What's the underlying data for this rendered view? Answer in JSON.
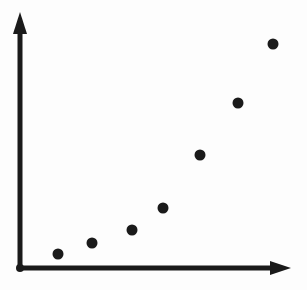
{
  "figure": {
    "name": "scatter-plot-diagram",
    "width": 307,
    "height": 290,
    "background_color": "#fdfdfd",
    "ink_color": "#1a1a1a",
    "has_labels": false,
    "has_tick_marks": false,
    "has_gridlines": false,
    "has_title": false,
    "has_legend": false
  },
  "axes": {
    "y_axis": {
      "name": "y-axis",
      "x": 20,
      "y_bottom": 268,
      "y_top": 12,
      "stroke_width": 5,
      "arrowhead": {
        "name": "y-axis-arrowhead",
        "tip_x": 20,
        "tip_y": 12,
        "base_y": 34,
        "half_width": 7
      }
    },
    "x_axis": {
      "name": "x-axis",
      "y": 268,
      "x_left": 20,
      "x_right": 291,
      "stroke_width": 5,
      "arrowhead": {
        "name": "x-axis-arrowhead",
        "tip_x": 291,
        "tip_y": 268,
        "base_x": 270,
        "half_height": 7
      }
    },
    "origin": {
      "name": "origin-junction",
      "x": 20,
      "y": 268,
      "radius": 4
    }
  },
  "chart_data": {
    "type": "scatter",
    "title": "",
    "subtitle": "",
    "xlabel": "",
    "ylabel": "",
    "xlim": [
      20,
      291
    ],
    "ylim": [
      12,
      268
    ],
    "grid": false,
    "legend": null,
    "marker": {
      "shape": "circle",
      "radius": 5.5,
      "color": "#1a1a1a"
    },
    "trend": "increasing-convex",
    "point_count": 7,
    "x": [
      58,
      92,
      132,
      163,
      200,
      238,
      273
    ],
    "y": [
      254,
      243,
      230,
      208,
      155,
      103,
      44
    ],
    "points": [
      {
        "name": "data-point-1",
        "cx": 58,
        "cy": 254
      },
      {
        "name": "data-point-2",
        "cx": 92,
        "cy": 243
      },
      {
        "name": "data-point-3",
        "cx": 132,
        "cy": 230
      },
      {
        "name": "data-point-4",
        "cx": 163,
        "cy": 208
      },
      {
        "name": "data-point-5",
        "cx": 200,
        "cy": 155
      },
      {
        "name": "data-point-6",
        "cx": 238,
        "cy": 103
      },
      {
        "name": "data-point-7",
        "cx": 273,
        "cy": 44
      }
    ]
  }
}
